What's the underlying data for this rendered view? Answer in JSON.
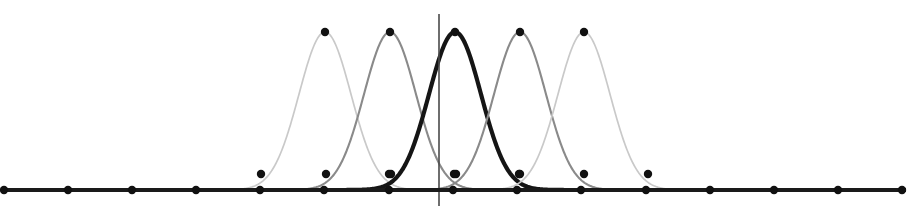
{
  "figure": {
    "background_color": "#ffffff",
    "width": 910,
    "height": 224
  },
  "chart_data": {
    "type": "line",
    "title": "",
    "subtitle": "",
    "xlabel": "",
    "ylabel": "",
    "grid": false,
    "legend": "none",
    "axes": {
      "x_axis": {
        "name": "horizontal-axis",
        "y_pixel": 190,
        "x_start_pixel": 4,
        "x_end_pixel": 906,
        "color": "#1a1a1a",
        "line_width": 4,
        "tick_marker": "filled-circle",
        "tick_pixels": [
          4,
          68,
          132,
          196,
          260,
          324,
          389,
          453,
          517,
          581,
          646,
          710,
          774,
          838,
          902
        ],
        "tick_labels": []
      },
      "y_axis": {
        "name": "vertical-axis",
        "x_pixel": 439,
        "y_top_pixel": 14,
        "y_bottom_pixel": 206,
        "color": "#4a4a4a",
        "line_width": 1.6,
        "tick_labels": []
      }
    },
    "x_domain": [
      0,
      910
    ],
    "y_domain": [
      0,
      1
    ],
    "baseline_pixel": 190,
    "peak_pixel": 32,
    "marker": {
      "shape": "filled-circle",
      "radius": 4.2,
      "color": "#111111",
      "positions_note": "one marker at each curve peak and one on each curve flank at y=174px"
    },
    "series": [
      {
        "name": "basis-1",
        "label": "φ₁",
        "center_pixel": 325,
        "sigma_pixel": 26,
        "amplitude": 1.0,
        "color": "#c9c9c9",
        "line_width": 1.7,
        "peak_marker": {
          "x": 325,
          "y": 32
        },
        "flank_markers": [
          {
            "x": 261,
            "y": 174
          },
          {
            "x": 389,
            "y": 174
          }
        ]
      },
      {
        "name": "basis-2",
        "label": "φ₂",
        "center_pixel": 390,
        "sigma_pixel": 26,
        "amplitude": 1.0,
        "color": "#8a8a8a",
        "line_width": 2.1,
        "peak_marker": {
          "x": 390,
          "y": 32
        },
        "flank_markers": [
          {
            "x": 326,
            "y": 174
          },
          {
            "x": 454,
            "y": 174
          }
        ]
      },
      {
        "name": "basis-3",
        "label": "φ₃",
        "center_pixel": 455,
        "sigma_pixel": 26,
        "amplitude": 1.0,
        "color": "#151515",
        "line_width": 4.2,
        "peak_marker": {
          "x": 455,
          "y": 32
        },
        "flank_markers": [
          {
            "x": 391,
            "y": 174
          },
          {
            "x": 519,
            "y": 174
          }
        ]
      },
      {
        "name": "basis-4",
        "label": "φ₄",
        "center_pixel": 520,
        "sigma_pixel": 26,
        "amplitude": 1.0,
        "color": "#8a8a8a",
        "line_width": 2.1,
        "peak_marker": {
          "x": 520,
          "y": 32
        },
        "flank_markers": [
          {
            "x": 456,
            "y": 174
          },
          {
            "x": 584,
            "y": 174
          }
        ]
      },
      {
        "name": "basis-5",
        "label": "φ₅",
        "center_pixel": 584,
        "sigma_pixel": 26,
        "amplitude": 1.0,
        "color": "#c9c9c9",
        "line_width": 1.7,
        "peak_marker": {
          "x": 584,
          "y": 32
        },
        "flank_markers": [
          {
            "x": 520,
            "y": 174
          },
          {
            "x": 648,
            "y": 174
          }
        ]
      }
    ]
  }
}
